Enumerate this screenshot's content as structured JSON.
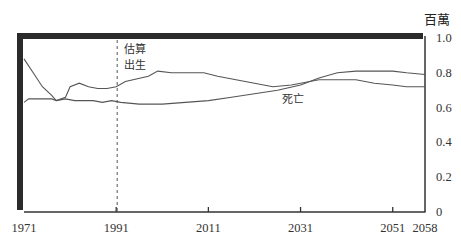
{
  "chart_data": {
    "type": "line",
    "title": "",
    "xlabel": "",
    "ylabel": "百萬",
    "xlim": [
      1971,
      2058
    ],
    "ylim": [
      0,
      1.0
    ],
    "x_ticks": [
      "1971",
      "1991",
      "2011",
      "2031",
      "2051",
      "2058"
    ],
    "y_ticks": [
      "0",
      "0.2",
      "0.4",
      "0.6",
      "0.8",
      "1.0"
    ],
    "grid": false,
    "legend": "inline labels",
    "annotations": [
      {
        "text": "估算",
        "x": 1992,
        "note": "dashed vertical line marking start of projection"
      },
      {
        "text": "出生",
        "series": "births"
      },
      {
        "text": "死亡",
        "series": "deaths"
      }
    ],
    "projection_start_year": 1991,
    "series": [
      {
        "name": "出生",
        "x": [
          1971,
          1973,
          1975,
          1977,
          1978,
          1980,
          1981,
          1983,
          1985,
          1987,
          1989,
          1991,
          1993,
          1998,
          2000,
          2003,
          2006,
          2010,
          2013,
          2017,
          2021,
          2025,
          2029,
          2031,
          2035,
          2039,
          2043,
          2045,
          2047,
          2051,
          2054,
          2058
        ],
        "values": [
          0.88,
          0.8,
          0.72,
          0.67,
          0.64,
          0.66,
          0.72,
          0.74,
          0.72,
          0.71,
          0.71,
          0.72,
          0.75,
          0.78,
          0.81,
          0.8,
          0.8,
          0.8,
          0.78,
          0.76,
          0.74,
          0.72,
          0.73,
          0.74,
          0.76,
          0.76,
          0.76,
          0.75,
          0.74,
          0.73,
          0.72,
          0.72
        ]
      },
      {
        "name": "死亡",
        "x": [
          1971,
          1972,
          1975,
          1977,
          1978,
          1980,
          1982,
          1984,
          1986,
          1988,
          1990,
          1992,
          1996,
          2001,
          2006,
          2011,
          2016,
          2021,
          2026,
          2031,
          2035,
          2039,
          2043,
          2046,
          2051,
          2054,
          2058
        ],
        "values": [
          0.63,
          0.65,
          0.65,
          0.65,
          0.64,
          0.65,
          0.64,
          0.64,
          0.64,
          0.63,
          0.64,
          0.63,
          0.62,
          0.62,
          0.63,
          0.64,
          0.66,
          0.68,
          0.7,
          0.73,
          0.77,
          0.8,
          0.81,
          0.81,
          0.81,
          0.8,
          0.79
        ]
      }
    ]
  },
  "labels": {
    "unit": "百萬",
    "estimate": "估算",
    "births": "出生",
    "deaths": "死亡"
  },
  "colors": {
    "frame": "#2a2a2a",
    "line": "#555555",
    "text": "#333333"
  }
}
